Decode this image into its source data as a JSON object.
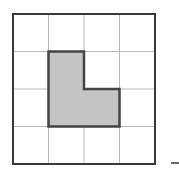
{
  "diagram": {
    "grid": {
      "rows": 4,
      "cols": 4,
      "x0": 13,
      "y0": 14,
      "cell_w": 35.5,
      "cell_h": 37.5,
      "line_color": "#b8b8b8",
      "border_color": "#3a3a3a"
    },
    "shaded_shape": {
      "description": "L-shaped region",
      "cells": [
        [
          1,
          1
        ],
        [
          1,
          2
        ],
        [
          2,
          2
        ]
      ],
      "area_units": 3,
      "fill": "#c4c4c4",
      "stroke": "#444444"
    },
    "answer_blank": {
      "x1": 171,
      "x2": 179,
      "y": 163,
      "color": "#333333"
    }
  }
}
